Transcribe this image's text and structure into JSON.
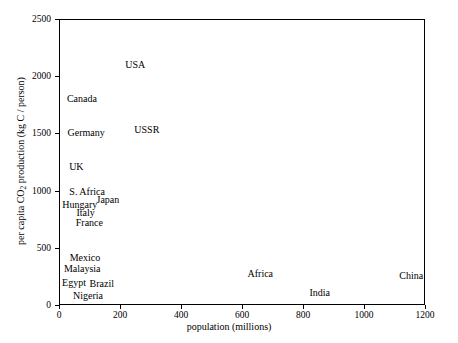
{
  "chart_data": {
    "type": "scatter",
    "title": "",
    "subtitle": "",
    "xlabel": "population (millions)",
    "ylabel_prefix": "per capita CO",
    "ylabel_subscript": "2",
    "ylabel_suffix": " production (kg C / person)",
    "ylabel_full": "per capita CO2 production (kg C / person)",
    "xlim": [
      0,
      1200
    ],
    "ylim": [
      0,
      2500
    ],
    "xticks": [
      0,
      200,
      400,
      600,
      800,
      1000,
      1200
    ],
    "yticks": [
      0,
      500,
      1000,
      1500,
      2000,
      2500
    ],
    "xticklabels": [
      "0",
      "200",
      "400",
      "600",
      "800",
      "1000",
      "1200"
    ],
    "yticklabels": [
      "0",
      "500",
      "1000",
      "1500",
      "2000",
      "2500"
    ],
    "grid": false,
    "legend": false,
    "marker_style": "text-label-only",
    "points": [
      {
        "label": "USA",
        "x": 250,
        "y": 2100,
        "align": "center"
      },
      {
        "label": "Canada",
        "x": 26,
        "y": 1800,
        "align": "left"
      },
      {
        "label": "Germany",
        "x": 28,
        "y": 1500,
        "align": "left"
      },
      {
        "label": "USSR",
        "x": 288,
        "y": 1530,
        "align": "center"
      },
      {
        "label": "UK",
        "x": 57,
        "y": 1210,
        "align": "center"
      },
      {
        "label": "S. Africa",
        "x": 34,
        "y": 990,
        "align": "left"
      },
      {
        "label": "Japan",
        "x": 123,
        "y": 920,
        "align": "left"
      },
      {
        "label": "Hungary",
        "x": 11,
        "y": 870,
        "align": "left"
      },
      {
        "label": "Italy",
        "x": 57,
        "y": 805,
        "align": "left"
      },
      {
        "label": "France",
        "x": 55,
        "y": 715,
        "align": "left"
      },
      {
        "label": "Mexico",
        "x": 85,
        "y": 410,
        "align": "center"
      },
      {
        "label": "Malaysia",
        "x": 16,
        "y": 315,
        "align": "left"
      },
      {
        "label": "Egypt",
        "x": 10,
        "y": 190,
        "align": "left"
      },
      {
        "label": "Brazil",
        "x": 100,
        "y": 185,
        "align": "left"
      },
      {
        "label": "Nigeria",
        "x": 95,
        "y": 75,
        "align": "center"
      },
      {
        "label": "Africa",
        "x": 660,
        "y": 275,
        "align": "center"
      },
      {
        "label": "India",
        "x": 855,
        "y": 105,
        "align": "center"
      },
      {
        "label": "China",
        "x": 1155,
        "y": 250,
        "align": "center"
      }
    ]
  },
  "axes": {
    "x_axis_name": "population (millions)",
    "y_axis_name": "per capita CO2 production (kg C / person)"
  },
  "colors": {
    "background": "#ffffff",
    "axis": "#000000",
    "text": "#000000"
  }
}
